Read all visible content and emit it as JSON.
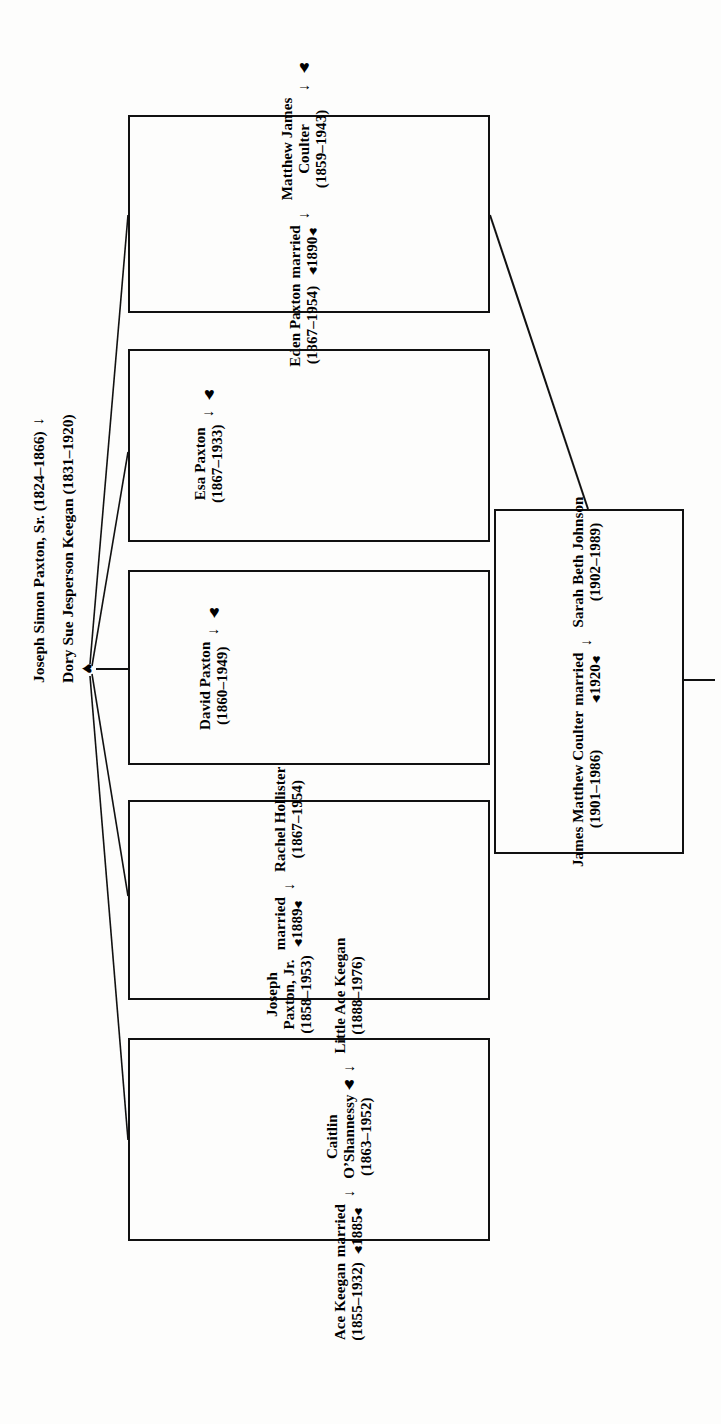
{
  "document": {
    "type": "family-tree-chart",
    "orientation": "rotated-90-ccw",
    "ink_color": "#111111",
    "paper_color": "#fdfdfc"
  },
  "roots": {
    "father": "Joseph Simon Paxton, Sr. (1824–1866)",
    "arrow": "→",
    "mother": "Dory Sue Jesperson Keegan (1831–1920)",
    "union_marker": "♥"
  },
  "glyphs": {
    "arrow": "→",
    "heart": "♥"
  },
  "children": [
    {
      "id": "ace-keegan",
      "person": {
        "name_lines": [
          "Ace Keegan"
        ],
        "dates": "(1855–1932)"
      },
      "marriage": {
        "label": "married",
        "heart_left": "♥",
        "year": "1885",
        "heart_right": "♥"
      },
      "arrow": "→",
      "spouse": {
        "name_lines": [
          "Caitlin",
          "O’Shannessy"
        ],
        "dates": "(1863–1952)"
      },
      "issue_heart": "♥",
      "issue_arrow": "→",
      "child": {
        "name_lines": [
          "Little Ace Keegan"
        ],
        "dates": "(1888–1976)"
      }
    },
    {
      "id": "joseph-paxton-jr",
      "person": {
        "name_lines": [
          "Joseph",
          "Paxton, Jr."
        ],
        "dates": "(1858–1953)"
      },
      "marriage": {
        "label": "married",
        "heart_left": "♥",
        "year": "1889",
        "heart_right": "♥"
      },
      "arrow": "→",
      "spouse": {
        "name_lines": [
          "Rachel Hollister"
        ],
        "dates": "(1867–1954)"
      },
      "issue_heart": null,
      "issue_arrow": null,
      "child": null
    },
    {
      "id": "david-paxton",
      "person": {
        "name_lines": [
          "David Paxton"
        ],
        "dates": "(1860–1949)"
      },
      "marriage": null,
      "arrow": "→",
      "spouse": null,
      "issue_heart": "♥",
      "issue_arrow": null,
      "child": null
    },
    {
      "id": "esa-paxton",
      "person": {
        "name_lines": [
          "Esa Paxton"
        ],
        "dates": "(1867–1933)"
      },
      "marriage": null,
      "arrow": "→",
      "spouse": null,
      "issue_heart": "♥",
      "issue_arrow": null,
      "child": null
    },
    {
      "id": "eden-paxton",
      "person": {
        "name_lines": [
          "Eden Paxton"
        ],
        "dates": "(1867–1954)"
      },
      "marriage": {
        "label": "married",
        "heart_left": "♥",
        "year": "1890",
        "heart_right": "♥"
      },
      "arrow": "→",
      "spouse": {
        "name_lines": [
          "Matthew James",
          "Coulter"
        ],
        "dates": "(1859–1943)"
      },
      "issue_heart": "♥",
      "issue_arrow": "→",
      "child": null
    }
  ],
  "grandchild_box": {
    "id": "james-matthew-coulter",
    "person": {
      "name_lines": [
        "James Matthew Coulter"
      ],
      "dates": "(1901–1986)"
    },
    "marriage": {
      "label": "married",
      "heart_left": "♥",
      "year": "1920",
      "heart_right": "♥"
    },
    "arrow": "→",
    "spouse": {
      "name_lines": [
        "Sarah Beth Johnson"
      ],
      "dates": "(1902–1989)"
    }
  }
}
